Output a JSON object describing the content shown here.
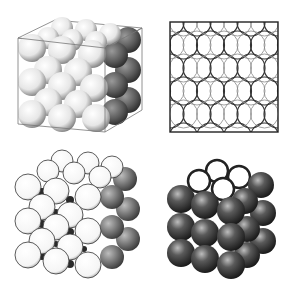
{
  "figure": {
    "panels": [
      {
        "id": "fcc-unit-cell-boxed",
        "description": "face-centered cubic packing of spheres inside cube outline",
        "style": "light"
      },
      {
        "id": "fcc-face-projection",
        "description": "square projection of interlocking circles pattern",
        "style": "line"
      },
      {
        "id": "fcc-with-interstitials",
        "description": "white sphere packing with small dark interstitial spheres",
        "style": "light"
      },
      {
        "id": "fcc-dark-spheres",
        "description": "dark shaded spheres with hollow top layer",
        "style": "dark"
      }
    ],
    "colors": {
      "background": "#ffffff",
      "sphere_light": "#f2f2f2",
      "sphere_shadow": "#555555",
      "sphere_dark": "#2e2e2e",
      "line": "#333333"
    }
  }
}
